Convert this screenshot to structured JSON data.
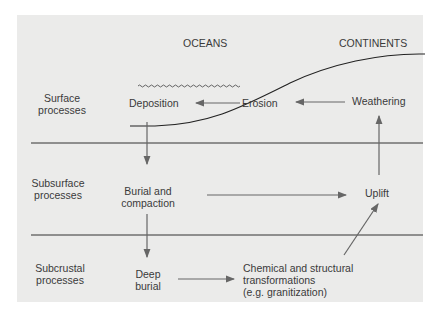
{
  "headers": {
    "oceans": "OCEANS",
    "continents": "CONTINENTS"
  },
  "rows": [
    {
      "line1": "Surface",
      "line2": "processes"
    },
    {
      "line1": "Subsurface",
      "line2": "processes"
    },
    {
      "line1": "Subcrustal",
      "line2": "processes"
    }
  ],
  "nodes": {
    "deposition": "Deposition",
    "erosion": "Erosion",
    "weathering": "Weathering",
    "burial_1": "Burial and",
    "burial_2": "compaction",
    "uplift": "Uplift",
    "deep_1": "Deep",
    "deep_2": "burial",
    "chem_1": "Chemical and structural",
    "chem_2": "transformations",
    "chem_3": "(e.g. granitization)"
  },
  "colors": {
    "panel": "#ebebea",
    "line": "#333333",
    "arrow": "#666666",
    "text": "#3a3a3a"
  }
}
